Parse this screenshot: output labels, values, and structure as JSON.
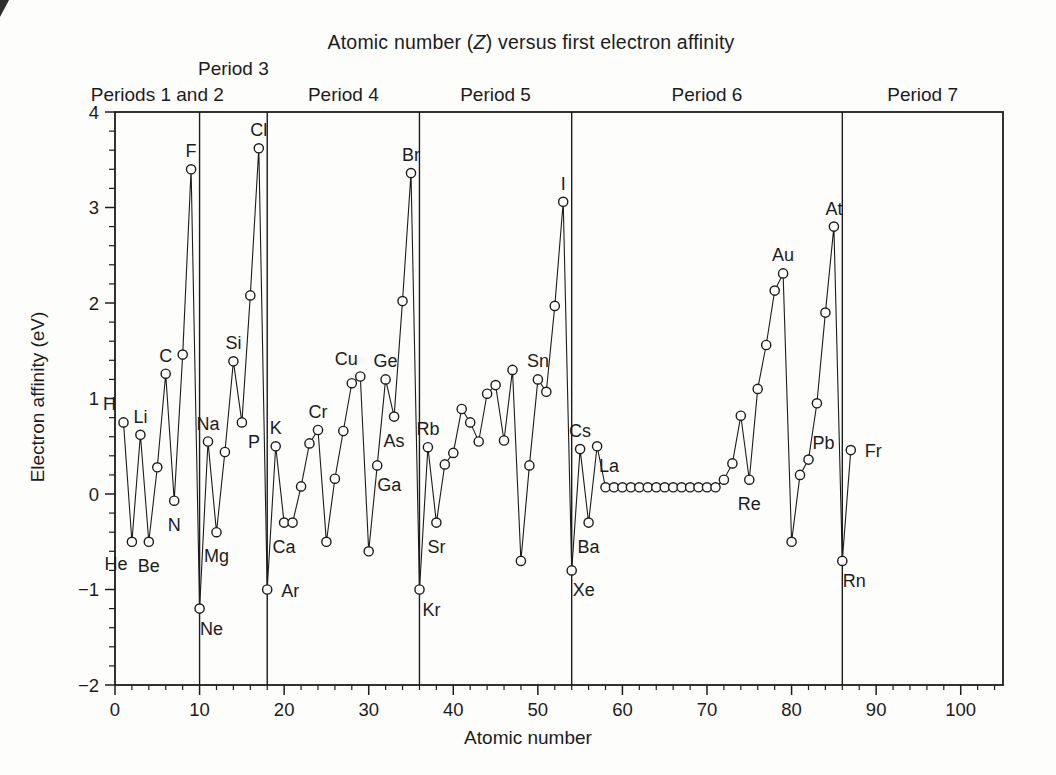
{
  "colors": {
    "ink": "#1c1c1c",
    "background": "#fdfdfc",
    "marker_fill": "#ffffff"
  },
  "figure": {
    "title_pre": "Atomic number (",
    "title_var": "Z",
    "title_post": ") versus first electron affinity",
    "x_axis_title": "Atomic number",
    "y_axis_title": "Electron affinity (eV)"
  },
  "chart_data": {
    "type": "line",
    "subtype": "scatter-line-open-circles",
    "title": "Atomic number (Z) versus first electron affinity",
    "xlabel": "Atomic number",
    "ylabel": "Electron affinity (eV)",
    "xlim": [
      0,
      105
    ],
    "ylim": [
      -2,
      4
    ],
    "grid": false,
    "legend": "none",
    "x_ticks": [
      {
        "v": 0,
        "label": "0"
      },
      {
        "v": 10,
        "label": "10"
      },
      {
        "v": 20,
        "label": "20"
      },
      {
        "v": 30,
        "label": "30"
      },
      {
        "v": 40,
        "label": "40"
      },
      {
        "v": 50,
        "label": "50"
      },
      {
        "v": 60,
        "label": "60"
      },
      {
        "v": 70,
        "label": "70"
      },
      {
        "v": 80,
        "label": "80"
      },
      {
        "v": 90,
        "label": "90"
      },
      {
        "v": 100,
        "label": "100"
      }
    ],
    "x_minor_step": 2,
    "y_ticks": [
      {
        "v": 4,
        "label": "4"
      },
      {
        "v": 3,
        "label": "3"
      },
      {
        "v": 2,
        "label": "2"
      },
      {
        "v": 1,
        "label": "1"
      },
      {
        "v": 0,
        "label": "0"
      },
      {
        "v": -1,
        "label": "−1"
      },
      {
        "v": -2,
        "label": "−2"
      }
    ],
    "y_minor_step": 0.2,
    "period_boundaries_z": [
      10,
      18,
      36,
      54,
      86
    ],
    "period_labels": [
      {
        "label": "Periods 1 and 2",
        "z_center": 5,
        "row": "low"
      },
      {
        "label": "Period 3",
        "z_center": 14,
        "row": "high"
      },
      {
        "label": "Period 4",
        "z_center": 27,
        "row": "low"
      },
      {
        "label": "Period 5",
        "z_center": 45,
        "row": "low"
      },
      {
        "label": "Period 6",
        "z_center": 70,
        "row": "low"
      },
      {
        "label": "Period 7",
        "z_center": 95.5,
        "row": "low"
      }
    ],
    "series": [
      {
        "name": "First electron affinity (eV)",
        "points": [
          {
            "z": 1,
            "symbol": "H",
            "ea": 0.75,
            "label_pos": "above-left"
          },
          {
            "z": 2,
            "symbol": "He",
            "ea": -0.5,
            "label_pos": "below-left"
          },
          {
            "z": 3,
            "symbol": "Li",
            "ea": 0.62,
            "label_pos": "above"
          },
          {
            "z": 4,
            "symbol": "Be",
            "ea": -0.5,
            "label_pos": "below"
          },
          {
            "z": 5,
            "symbol": "B",
            "ea": 0.28
          },
          {
            "z": 6,
            "symbol": "C",
            "ea": 1.26,
            "label_pos": "above"
          },
          {
            "z": 7,
            "symbol": "N",
            "ea": -0.07,
            "label_pos": "below"
          },
          {
            "z": 8,
            "symbol": "O",
            "ea": 1.46
          },
          {
            "z": 9,
            "symbol": "F",
            "ea": 3.4,
            "label_pos": "above"
          },
          {
            "z": 10,
            "symbol": "Ne",
            "ea": -1.2,
            "label_pos": "below-right"
          },
          {
            "z": 11,
            "symbol": "Na",
            "ea": 0.55,
            "label_pos": "above"
          },
          {
            "z": 12,
            "symbol": "Mg",
            "ea": -0.4,
            "label_pos": "below"
          },
          {
            "z": 13,
            "symbol": "Al",
            "ea": 0.44
          },
          {
            "z": 14,
            "symbol": "Si",
            "ea": 1.39,
            "label_pos": "above"
          },
          {
            "z": 15,
            "symbol": "P",
            "ea": 0.75,
            "label_pos": "below-right"
          },
          {
            "z": 16,
            "symbol": "S",
            "ea": 2.08
          },
          {
            "z": 17,
            "symbol": "Cl",
            "ea": 3.62,
            "label_pos": "above"
          },
          {
            "z": 18,
            "symbol": "Ar",
            "ea": -1.0,
            "label_pos": "right"
          },
          {
            "z": 19,
            "symbol": "K",
            "ea": 0.5,
            "label_pos": "above"
          },
          {
            "z": 20,
            "symbol": "Ca",
            "ea": -0.3,
            "label_pos": "below"
          },
          {
            "z": 21,
            "symbol": "Sc",
            "ea": -0.3
          },
          {
            "z": 22,
            "symbol": "Ti",
            "ea": 0.08
          },
          {
            "z": 23,
            "symbol": "V",
            "ea": 0.53
          },
          {
            "z": 24,
            "symbol": "Cr",
            "ea": 0.67,
            "label_pos": "above"
          },
          {
            "z": 25,
            "symbol": "Mn",
            "ea": -0.5
          },
          {
            "z": 26,
            "symbol": "Fe",
            "ea": 0.16
          },
          {
            "z": 27,
            "symbol": "Co",
            "ea": 0.66
          },
          {
            "z": 28,
            "symbol": "Ni",
            "ea": 1.16
          },
          {
            "z": 29,
            "symbol": "Cu",
            "ea": 1.23,
            "label_pos": "above-left"
          },
          {
            "z": 30,
            "symbol": "Zn",
            "ea": -0.6
          },
          {
            "z": 31,
            "symbol": "Ga",
            "ea": 0.3,
            "label_pos": "below-right"
          },
          {
            "z": 32,
            "symbol": "Ge",
            "ea": 1.2,
            "label_pos": "above"
          },
          {
            "z": 33,
            "symbol": "As",
            "ea": 0.81,
            "label_pos": "below"
          },
          {
            "z": 34,
            "symbol": "Se",
            "ea": 2.02
          },
          {
            "z": 35,
            "symbol": "Br",
            "ea": 3.36,
            "label_pos": "above"
          },
          {
            "z": 36,
            "symbol": "Kr",
            "ea": -1.0,
            "label_pos": "below-right"
          },
          {
            "z": 37,
            "symbol": "Rb",
            "ea": 0.49,
            "label_pos": "above"
          },
          {
            "z": 38,
            "symbol": "Sr",
            "ea": -0.3,
            "label_pos": "below"
          },
          {
            "z": 39,
            "symbol": "Y",
            "ea": 0.31
          },
          {
            "z": 40,
            "symbol": "Zr",
            "ea": 0.43
          },
          {
            "z": 41,
            "symbol": "Nb",
            "ea": 0.89
          },
          {
            "z": 42,
            "symbol": "Mo",
            "ea": 0.75
          },
          {
            "z": 43,
            "symbol": "Tc",
            "ea": 0.55
          },
          {
            "z": 44,
            "symbol": "Ru",
            "ea": 1.05
          },
          {
            "z": 45,
            "symbol": "Rh",
            "ea": 1.14
          },
          {
            "z": 46,
            "symbol": "Pd",
            "ea": 0.56
          },
          {
            "z": 47,
            "symbol": "Ag",
            "ea": 1.3
          },
          {
            "z": 48,
            "symbol": "Cd",
            "ea": -0.7
          },
          {
            "z": 49,
            "symbol": "In",
            "ea": 0.3
          },
          {
            "z": 50,
            "symbol": "Sn",
            "ea": 1.2,
            "label_pos": "above"
          },
          {
            "z": 51,
            "symbol": "Sb",
            "ea": 1.07
          },
          {
            "z": 52,
            "symbol": "Te",
            "ea": 1.97
          },
          {
            "z": 53,
            "symbol": "I",
            "ea": 3.06,
            "label_pos": "above"
          },
          {
            "z": 54,
            "symbol": "Xe",
            "ea": -0.8,
            "label_pos": "below-right"
          },
          {
            "z": 55,
            "symbol": "Cs",
            "ea": 0.47,
            "label_pos": "above"
          },
          {
            "z": 56,
            "symbol": "Ba",
            "ea": -0.3,
            "label_pos": "below"
          },
          {
            "z": 57,
            "symbol": "La",
            "ea": 0.5,
            "label_pos": "below-right"
          },
          {
            "z": 58,
            "symbol": "Ce",
            "ea": 0.07
          },
          {
            "z": 59,
            "symbol": "Pr",
            "ea": 0.07
          },
          {
            "z": 60,
            "symbol": "Nd",
            "ea": 0.07
          },
          {
            "z": 61,
            "symbol": "Pm",
            "ea": 0.07
          },
          {
            "z": 62,
            "symbol": "Sm",
            "ea": 0.07
          },
          {
            "z": 63,
            "symbol": "Eu",
            "ea": 0.07
          },
          {
            "z": 64,
            "symbol": "Gd",
            "ea": 0.07
          },
          {
            "z": 65,
            "symbol": "Tb",
            "ea": 0.07
          },
          {
            "z": 66,
            "symbol": "Dy",
            "ea": 0.07
          },
          {
            "z": 67,
            "symbol": "Ho",
            "ea": 0.07
          },
          {
            "z": 68,
            "symbol": "Er",
            "ea": 0.07
          },
          {
            "z": 69,
            "symbol": "Tm",
            "ea": 0.07
          },
          {
            "z": 70,
            "symbol": "Yb",
            "ea": 0.07
          },
          {
            "z": 71,
            "symbol": "Lu",
            "ea": 0.07
          },
          {
            "z": 72,
            "symbol": "Hf",
            "ea": 0.15
          },
          {
            "z": 73,
            "symbol": "Ta",
            "ea": 0.32
          },
          {
            "z": 74,
            "symbol": "W",
            "ea": 0.82
          },
          {
            "z": 75,
            "symbol": "Re",
            "ea": 0.15,
            "label_pos": "below"
          },
          {
            "z": 76,
            "symbol": "Os",
            "ea": 1.1
          },
          {
            "z": 77,
            "symbol": "Ir",
            "ea": 1.56
          },
          {
            "z": 78,
            "symbol": "Pt",
            "ea": 2.13
          },
          {
            "z": 79,
            "symbol": "Au",
            "ea": 2.31,
            "label_pos": "above"
          },
          {
            "z": 80,
            "symbol": "Hg",
            "ea": -0.5
          },
          {
            "z": 81,
            "symbol": "Tl",
            "ea": 0.2
          },
          {
            "z": 82,
            "symbol": "Pb",
            "ea": 0.36,
            "label_pos": "above-right"
          },
          {
            "z": 83,
            "symbol": "Bi",
            "ea": 0.95
          },
          {
            "z": 84,
            "symbol": "Po",
            "ea": 1.9
          },
          {
            "z": 85,
            "symbol": "At",
            "ea": 2.8,
            "label_pos": "above"
          },
          {
            "z": 86,
            "symbol": "Rn",
            "ea": -0.7,
            "label_pos": "below-right"
          },
          {
            "z": 87,
            "symbol": "Fr",
            "ea": 0.46,
            "label_pos": "right"
          }
        ]
      }
    ]
  }
}
